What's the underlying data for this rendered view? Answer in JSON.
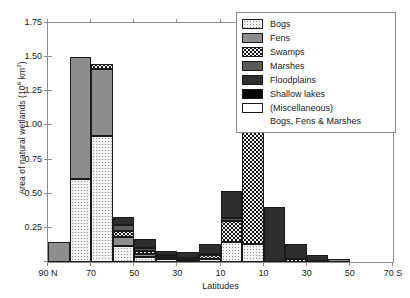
{
  "chart_data": {
    "type": "bar",
    "stacked": true,
    "title": "",
    "xlabel": "Latitudes",
    "ylabel": "Area of natural wetlands (10^6 km^2)",
    "ylabel_prefix": "Area of natural wetlands (10",
    "ylabel_sup": "6",
    "ylabel_suffix": " km",
    "ylabel_sup2": "2",
    "ylabel_end": ")",
    "ylim": [
      0,
      1.75
    ],
    "yticks": [
      0,
      0.25,
      0.5,
      0.75,
      1.0,
      1.25,
      1.5,
      1.75
    ],
    "ytick_labels": [
      "",
      "0.25",
      "0.50",
      "0.75",
      "1.00",
      "1.25",
      "1.50",
      "1.75"
    ],
    "xlim": [
      90,
      -70
    ],
    "xticks": [
      90,
      70,
      50,
      30,
      10,
      -10,
      -30,
      -50,
      -70
    ],
    "xtick_labels": [
      "90 N",
      "70",
      "50",
      "30",
      "10",
      "10",
      "30",
      "50",
      "70 S"
    ],
    "grid": false,
    "legend_position": "top-right",
    "categories": [
      "80-90N",
      "70-80N",
      "60-70N",
      "50-60N",
      "40-50N",
      "30-40N",
      "20-30N",
      "10-20N",
      "0-10N",
      "0-10S",
      "10-20S",
      "20-30S",
      "30-40S",
      "40-50S",
      "50-60S"
    ],
    "bin_left_lat": [
      90,
      80,
      70,
      60,
      50,
      40,
      30,
      20,
      10,
      0,
      -10,
      -20,
      -30,
      -40,
      -50
    ],
    "bin_right_lat": [
      80,
      70,
      60,
      50,
      40,
      30,
      20,
      10,
      0,
      -10,
      -20,
      -30,
      -40,
      -50,
      -60
    ],
    "series": [
      {
        "name": "Bogs",
        "values": [
          0.0,
          0.61,
          0.92,
          0.12,
          0.04,
          0.02,
          0.01,
          0.02,
          0.15,
          0.13,
          0.0,
          0.0,
          0.0,
          0.0,
          0.0
        ]
      },
      {
        "name": "Fens",
        "values": [
          0.15,
          0.89,
          0.49,
          0.06,
          0.02,
          0.01,
          0.0,
          0.0,
          0.0,
          0.0,
          0.0,
          0.0,
          0.0,
          0.02,
          0.0
        ]
      },
      {
        "name": "Swamps",
        "values": [
          0.0,
          0.0,
          0.04,
          0.05,
          0.02,
          0.01,
          0.01,
          0.03,
          0.15,
          0.87,
          0.0,
          0.02,
          0.01,
          0.0,
          0.0
        ]
      },
      {
        "name": "Marshes",
        "values": [
          0.0,
          0.0,
          0.0,
          0.04,
          0.02,
          0.01,
          0.01,
          0.01,
          0.02,
          0.0,
          0.0,
          0.0,
          0.0,
          0.0,
          0.0
        ]
      },
      {
        "name": "Floodplains",
        "values": [
          0.0,
          0.0,
          0.0,
          0.06,
          0.07,
          0.03,
          0.04,
          0.07,
          0.2,
          0.0,
          0.4,
          0.11,
          0.04,
          0.0,
          0.0
        ]
      },
      {
        "name": "Shallow lakes",
        "values": [
          0.0,
          0.0,
          0.0,
          0.0,
          0.0,
          0.0,
          0.0,
          0.0,
          0.0,
          0.08,
          0.0,
          0.0,
          0.0,
          0.0,
          0.0
        ]
      },
      {
        "name": "(Miscellaneous)",
        "values": [
          0.0,
          0.0,
          0.0,
          0.0,
          0.0,
          0.0,
          0.0,
          0.0,
          0.0,
          0.0,
          0.0,
          0.0,
          0.0,
          0.0,
          0.0
        ]
      }
    ],
    "totals": [
      0.15,
      1.5,
      1.45,
      0.33,
      0.17,
      0.08,
      0.07,
      0.13,
      0.52,
      1.08,
      0.4,
      0.13,
      0.05,
      0.02,
      0.0
    ]
  },
  "legend": {
    "items": [
      {
        "label": "Bogs",
        "key": "bogs",
        "color": "#f4f4f4"
      },
      {
        "label": "Fens",
        "key": "fens",
        "color": "#8e8e8e"
      },
      {
        "label": "Swamps",
        "key": "swamps",
        "color": "#efefef"
      },
      {
        "label": "Marshes",
        "key": "marshes",
        "color": "#5a5a5a"
      },
      {
        "label": "Floodplains",
        "key": "floodplains",
        "color": "#2e2e2e"
      },
      {
        "label": "Shallow lakes",
        "key": "shallow",
        "color": "#070707"
      },
      {
        "label": "(Miscellaneous)",
        "key": "misc",
        "color": "#ffffff"
      }
    ],
    "continuation": "Bogs, Fens & Marshes"
  }
}
